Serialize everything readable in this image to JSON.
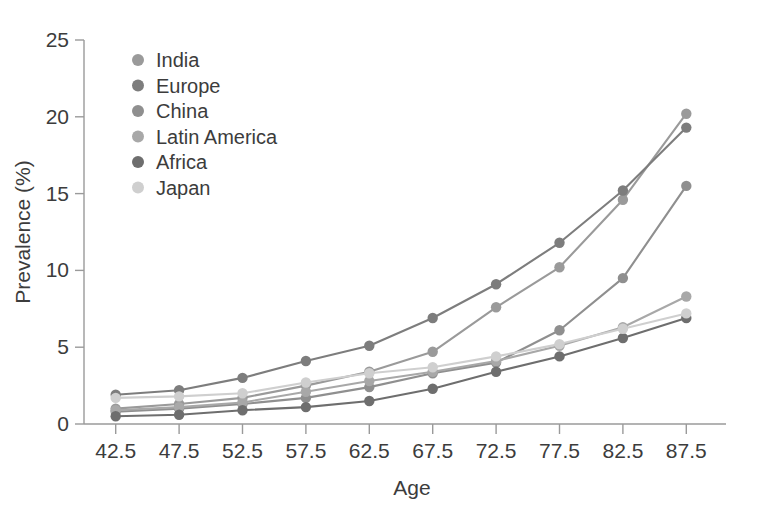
{
  "chart_data": {
    "type": "line",
    "title": "",
    "xlabel": "Age",
    "ylabel": "Prevalence (%)",
    "categories": [
      "42.5",
      "47.5",
      "52.5",
      "57.5",
      "62.5",
      "67.5",
      "72.5",
      "77.5",
      "82.5",
      "87.5"
    ],
    "x": [
      42.5,
      47.5,
      52.5,
      57.5,
      62.5,
      67.5,
      72.5,
      77.5,
      82.5,
      87.5
    ],
    "xlim": [
      40,
      90
    ],
    "ylim": [
      0,
      25
    ],
    "yticks": [
      0,
      5,
      10,
      15,
      20,
      25
    ],
    "xticks": [
      42.5,
      47.5,
      52.5,
      57.5,
      62.5,
      67.5,
      72.5,
      77.5,
      82.5,
      87.5
    ],
    "grid": false,
    "legend_position": "top-left",
    "markers": true,
    "series": [
      {
        "name": "India",
        "color": "#9a9a9a",
        "values": [
          1.0,
          1.3,
          1.7,
          2.5,
          3.4,
          4.7,
          7.6,
          10.2,
          14.6,
          20.2
        ]
      },
      {
        "name": "Europe",
        "color": "#7d7d7d",
        "values": [
          1.9,
          2.2,
          3.0,
          4.1,
          5.1,
          6.9,
          9.1,
          11.8,
          15.2,
          19.3
        ]
      },
      {
        "name": "China",
        "color": "#8f8f8f",
        "values": [
          0.8,
          1.0,
          1.3,
          1.7,
          2.4,
          3.3,
          4.0,
          6.1,
          9.5,
          15.5
        ]
      },
      {
        "name": "Latin America",
        "color": "#a8a8a8",
        "values": [
          0.9,
          1.1,
          1.4,
          2.1,
          2.8,
          3.4,
          4.1,
          5.1,
          6.3,
          8.3
        ]
      },
      {
        "name": "Africa",
        "color": "#6e6e6e",
        "values": [
          0.5,
          0.6,
          0.9,
          1.1,
          1.5,
          2.3,
          3.4,
          4.4,
          5.6,
          6.9
        ]
      },
      {
        "name": "Japan",
        "color": "#cfcfcf",
        "values": [
          1.7,
          1.8,
          2.0,
          2.7,
          3.3,
          3.7,
          4.4,
          5.2,
          6.2,
          7.2
        ]
      }
    ]
  },
  "legend": {
    "items": [
      {
        "label": "India"
      },
      {
        "label": "Europe"
      },
      {
        "label": "China"
      },
      {
        "label": "Latin America"
      },
      {
        "label": "Africa"
      },
      {
        "label": "Japan"
      }
    ]
  }
}
